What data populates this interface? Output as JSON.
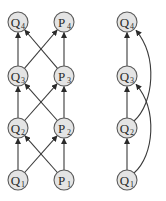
{
  "diagram": {
    "colors": {
      "node_fill": "#e4e4e4",
      "node_stroke": "#5a5a5a",
      "edge": "#3a3a3a",
      "background": "#ffffff"
    },
    "left_graph": {
      "nodes": [
        {
          "id": "Q1",
          "letter": "Q",
          "sub": "1",
          "x": 18,
          "y": 180
        },
        {
          "id": "P1",
          "letter": "P",
          "sub": "1",
          "x": 64,
          "y": 180
        },
        {
          "id": "Q2",
          "letter": "Q",
          "sub": "2",
          "x": 18,
          "y": 128
        },
        {
          "id": "P2",
          "letter": "P",
          "sub": "2",
          "x": 64,
          "y": 128
        },
        {
          "id": "Q3",
          "letter": "Q",
          "sub": "3",
          "x": 18,
          "y": 76
        },
        {
          "id": "P3",
          "letter": "P",
          "sub": "3",
          "x": 64,
          "y": 76
        },
        {
          "id": "Q4",
          "letter": "Q",
          "sub": "4",
          "x": 18,
          "y": 22
        },
        {
          "id": "P4",
          "letter": "P",
          "sub": "4",
          "x": 64,
          "y": 22
        }
      ],
      "edges": [
        {
          "from": "Q1",
          "to": "Q2"
        },
        {
          "from": "P1",
          "to": "P2"
        },
        {
          "from": "Q1",
          "to": "P2"
        },
        {
          "from": "P1",
          "to": "Q2"
        },
        {
          "from": "Q2",
          "to": "Q3"
        },
        {
          "from": "P2",
          "to": "P3"
        },
        {
          "from": "Q2",
          "to": "P3"
        },
        {
          "from": "P2",
          "to": "Q3"
        },
        {
          "from": "Q3",
          "to": "Q4"
        },
        {
          "from": "P3",
          "to": "P4"
        },
        {
          "from": "Q3",
          "to": "P4"
        },
        {
          "from": "P3",
          "to": "Q4"
        }
      ]
    },
    "right_graph": {
      "nodes": [
        {
          "id": "R_Q1",
          "letter": "Q",
          "sub": "1",
          "x": 127,
          "y": 180
        },
        {
          "id": "R_Q2",
          "letter": "Q",
          "sub": "2",
          "x": 127,
          "y": 128
        },
        {
          "id": "R_Q3",
          "letter": "Q",
          "sub": "3",
          "x": 127,
          "y": 76
        },
        {
          "id": "R_Q4",
          "letter": "Q",
          "sub": "4",
          "x": 127,
          "y": 22
        }
      ],
      "edges": [
        {
          "from": "R_Q1",
          "to": "R_Q2",
          "type": "straight"
        },
        {
          "from": "R_Q2",
          "to": "R_Q3",
          "type": "straight"
        },
        {
          "from": "R_Q3",
          "to": "R_Q4",
          "type": "straight"
        },
        {
          "from": "R_Q1",
          "to": "R_Q3",
          "type": "curved"
        },
        {
          "from": "R_Q2",
          "to": "R_Q4",
          "type": "curved"
        }
      ]
    },
    "node_radius": 10
  }
}
